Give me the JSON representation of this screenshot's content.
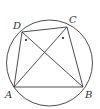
{
  "diagram": {
    "type": "cyclic-quadrilateral",
    "circle": {
      "cx": 49.5,
      "cy": 63,
      "r": 43
    },
    "points": {
      "A": {
        "x": 14,
        "y": 87,
        "label": "A",
        "lx": 5,
        "ly": 98
      },
      "B": {
        "x": 83,
        "y": 87,
        "label": "B",
        "lx": 85,
        "ly": 98
      },
      "C": {
        "x": 67,
        "y": 27,
        "label": "C",
        "lx": 69,
        "ly": 23
      },
      "D": {
        "x": 22,
        "y": 32,
        "label": "D",
        "lx": 13,
        "ly": 29
      }
    },
    "segments": [
      [
        "A",
        "B"
      ],
      [
        "B",
        "C"
      ],
      [
        "C",
        "D"
      ],
      [
        "D",
        "A"
      ],
      [
        "A",
        "C"
      ],
      [
        "B",
        "D"
      ]
    ],
    "angle_marks": [
      {
        "at": "D",
        "x": 26,
        "y": 40
      },
      {
        "at": "C",
        "x": 63,
        "y": 38
      }
    ],
    "colors": {
      "line": "#3a3a3a",
      "text": "#333333",
      "background": "#ffffff"
    }
  }
}
